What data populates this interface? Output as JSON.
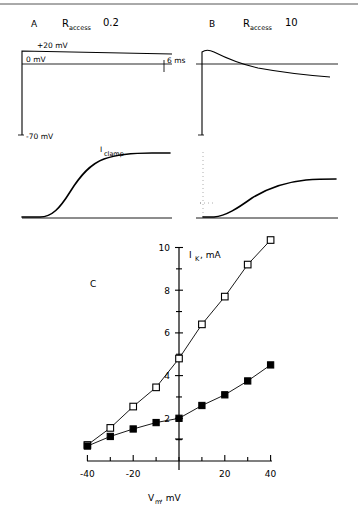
{
  "figure": {
    "top_rule": true,
    "panels": [
      {
        "letter": "A",
        "condition_symbol": "R",
        "condition_sub": "access",
        "condition_value": "0.2",
        "voltage_labels": {
          "high": "+20 mV",
          "zero": "0 mV",
          "hold": "-70 mV",
          "time_scale": "6 ms"
        }
      },
      {
        "letter": "B",
        "condition_symbol": "R",
        "condition_sub": "access",
        "condition_value": "10",
        "voltage_labels": {
          "high": "",
          "zero": "",
          "hold": "",
          "time_scale": ""
        }
      }
    ],
    "current_trace_label": {
      "symbol": "I",
      "subscript": "clamp"
    },
    "panel_c_letter": "C"
  },
  "chart_data": {
    "type": "line",
    "title": "",
    "xlabel_symbol": "V",
    "xlabel_sub": "m",
    "xlabel_unit": ", mV",
    "ylabel_symbol": "I",
    "ylabel_sub": "K",
    "ylabel_unit": ", mA",
    "xlim": [
      -45,
      45
    ],
    "ylim": [
      0,
      10.8
    ],
    "xticks_major": [
      -40,
      -20,
      20,
      40
    ],
    "xticks_minor": [
      -40,
      -30,
      -20,
      -10,
      0,
      10,
      20,
      30,
      40
    ],
    "xtick_labels": [
      "-40",
      "-20",
      "20",
      "40"
    ],
    "yticks_major": [
      2,
      4,
      6,
      8,
      10
    ],
    "yticks_minor": [
      1,
      2,
      3,
      4,
      5,
      6,
      7,
      8,
      9,
      10
    ],
    "ytick_labels": [
      "2",
      "4",
      "6",
      "8",
      "10"
    ],
    "grid": false,
    "legend": "none",
    "series": [
      {
        "name": "Raccess 0.2",
        "marker": "open-square",
        "x": [
          -40,
          -30,
          -20,
          -10,
          0,
          10,
          20,
          30,
          40
        ],
        "values": [
          0.75,
          1.55,
          2.55,
          3.45,
          4.8,
          6.4,
          7.7,
          9.2,
          10.35
        ]
      },
      {
        "name": "Raccess 10",
        "marker": "filled-square",
        "x": [
          -40,
          -30,
          -20,
          -10,
          0,
          10,
          20,
          30,
          40
        ],
        "values": [
          0.7,
          1.15,
          1.5,
          1.8,
          2.0,
          2.6,
          3.1,
          3.75,
          4.5
        ]
      }
    ]
  }
}
